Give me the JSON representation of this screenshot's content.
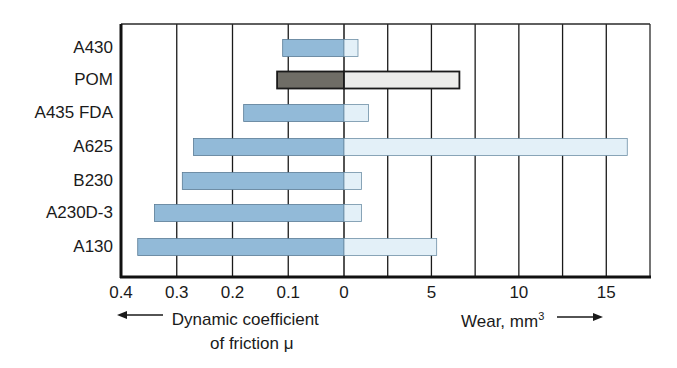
{
  "chart_data": {
    "type": "bar",
    "orientation": "horizontal-diverging",
    "categories": [
      "A430",
      "POM",
      "A435 FDA",
      "A625",
      "B230",
      "A230D-3",
      "A130"
    ],
    "series": [
      {
        "name": "Dynamic coefficient of friction μ",
        "side": "left",
        "values": [
          0.11,
          0.12,
          0.18,
          0.27,
          0.29,
          0.34,
          0.37
        ],
        "axis_range": [
          0,
          0.4
        ],
        "ticks": [
          0.4,
          0.3,
          0.2,
          0.1,
          0
        ],
        "tick_labels": [
          "0.4",
          "0.3",
          "0.2",
          "0.1",
          "0"
        ]
      },
      {
        "name": "Wear, mm³",
        "side": "right",
        "values": [
          0.8,
          6.6,
          1.4,
          16.2,
          1.0,
          1.0,
          5.3
        ],
        "axis_range": [
          0,
          17.5
        ],
        "ticks": [
          5,
          10,
          15
        ],
        "tick_labels": [
          "5",
          "10",
          "15"
        ],
        "gridlines": [
          2.5,
          5,
          7.5,
          10,
          12.5,
          15
        ]
      }
    ],
    "highlight": {
      "category": "POM",
      "friction_color": "#6f6d66",
      "wear_color": "#ececea"
    },
    "colors": {
      "friction": "#92bad8",
      "wear": "#e3f0f8",
      "border": "#2a2a2a",
      "grid": "#1a1a1a"
    },
    "xlabel_left": "Dynamic coefficient of friction μ",
    "xlabel_right": "Wear, mm³",
    "title": "",
    "grid": true,
    "legend": "none"
  },
  "labels": {
    "left_axis_line1": "Dynamic coefficient",
    "left_axis_line2": "of friction μ",
    "right_axis_text": "Wear, mm",
    "right_axis_sup": "3",
    "arrow_left": "⟵",
    "arrow_right": "⟶"
  }
}
